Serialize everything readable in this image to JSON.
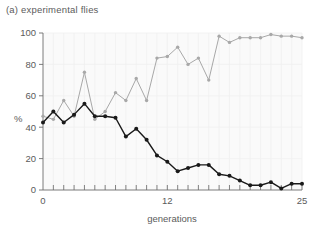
{
  "panel": {
    "label": "(a)  experimental flies"
  },
  "chart_data": {
    "type": "line",
    "title": "(a) experimental flies",
    "xlabel": "generations",
    "ylabel": "%",
    "xlim": [
      0,
      25
    ],
    "ylim": [
      0,
      100
    ],
    "xticks": [
      0,
      12,
      25
    ],
    "xtick_labels": [
      "0",
      "12",
      "25"
    ],
    "xminorticks": [
      1,
      2,
      3,
      4,
      5,
      6,
      7,
      8,
      9,
      10,
      11,
      13,
      14,
      15,
      16,
      17,
      18,
      19,
      20,
      21,
      22,
      23,
      24
    ],
    "yticks": [
      0,
      20,
      40,
      60,
      80,
      100
    ],
    "ytick_labels": [
      "0",
      "20",
      "40",
      "60",
      "80",
      "100"
    ],
    "grid": true,
    "legend": "none",
    "x": [
      0,
      1,
      2,
      3,
      4,
      5,
      6,
      7,
      8,
      9,
      10,
      11,
      12,
      13,
      14,
      15,
      16,
      17,
      18,
      19,
      20,
      21,
      22,
      23,
      24,
      25
    ],
    "series": [
      {
        "name": "grey-series",
        "color": "#a8a8a8",
        "marker": "circle",
        "values": [
          47,
          45,
          57,
          47,
          75,
          45,
          50,
          62,
          57,
          71,
          57,
          84,
          85,
          91,
          80,
          84,
          70,
          98,
          94,
          97,
          97,
          97,
          99,
          98,
          98,
          97
        ]
      },
      {
        "name": "black-series",
        "color": "#1a1a1a",
        "marker": "circle",
        "values": [
          43,
          50,
          43,
          48,
          55,
          47,
          47,
          46,
          34,
          39,
          32,
          22,
          18,
          12,
          14,
          16,
          16,
          10,
          9,
          6,
          3,
          3,
          5,
          1,
          4,
          4
        ]
      }
    ]
  },
  "axes": {
    "y_label": "%",
    "x_label": "generations",
    "y_tick_labels": [
      "0",
      "20",
      "40",
      "60",
      "80",
      "100"
    ],
    "x_tick_labels": [
      "0",
      "12",
      "25"
    ]
  },
  "colors": {
    "grey_series": "#a8a8a8",
    "black_series": "#1a1a1a",
    "axis": "#6e6e6e",
    "grid": "#f0f0f0",
    "plot_bg": "#fafafa",
    "text": "#5b5b5b"
  }
}
